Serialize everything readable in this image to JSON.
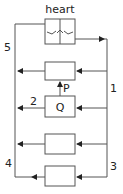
{
  "diagram": {
    "title": "heart",
    "labels": {
      "l1": "1",
      "l2": "2",
      "l3": "3",
      "l4": "4",
      "l5": "5",
      "p": "P",
      "q": "Q"
    },
    "colors": {
      "line": "#444444",
      "background": "#ffffff"
    }
  }
}
